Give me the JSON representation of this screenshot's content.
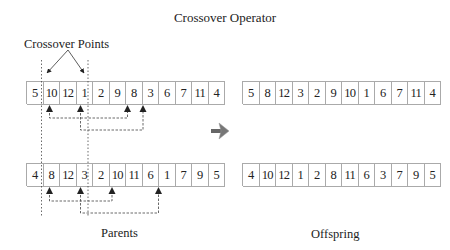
{
  "title": "Crossover Operator",
  "labels": {
    "crossover_points": "Crossover Points",
    "parents": "Parents",
    "offspring": "Offspring"
  },
  "parents": [
    {
      "genes": [
        "5",
        "10",
        "12",
        "1",
        "2",
        "9",
        "8",
        "3",
        "6",
        "7",
        "11",
        "4"
      ]
    },
    {
      "genes": [
        "4",
        "8",
        "12",
        "3",
        "2",
        "10",
        "11",
        "6",
        "1",
        "7",
        "9",
        "5"
      ]
    }
  ],
  "offspring": [
    {
      "genes": [
        "5",
        "8",
        "12",
        "3",
        "2",
        "9",
        "10",
        "1",
        "6",
        "7",
        "11",
        "4"
      ]
    },
    {
      "genes": [
        "4",
        "10",
        "12",
        "1",
        "2",
        "8",
        "11",
        "6",
        "3",
        "7",
        "9",
        "5"
      ]
    }
  ],
  "crossover_points": {
    "after_gene_index": [
      0,
      3
    ]
  },
  "swaps": {
    "parent1": [
      [
        1,
        6
      ],
      [
        3,
        7
      ]
    ],
    "parent2": [
      [
        1,
        5
      ],
      [
        3,
        8
      ]
    ]
  },
  "colors": {
    "line": "#333333",
    "cell_border": "#aaaaaa",
    "arrow": "#555555"
  }
}
